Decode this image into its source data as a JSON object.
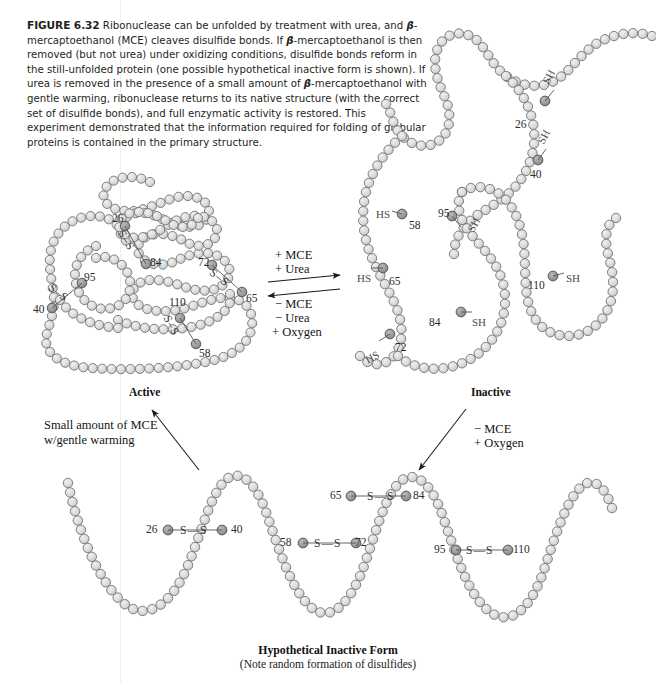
{
  "figure": {
    "number": "FIGURE 6.32",
    "caption_runs": [
      {
        "t": "FIGURE 6.32",
        "s": "fignum"
      },
      {
        "t": " Ribonuclease can be unfolded by treatment with urea, and ",
        "s": "plain"
      },
      {
        "t": "β",
        "s": "beta"
      },
      {
        "t": "-mercaptoethanol (MCE) cleaves disulfide bonds. If ",
        "s": "plain"
      },
      {
        "t": "β",
        "s": "beta"
      },
      {
        "t": "-mercaptoethanol is then removed (but not urea) under oxidizing conditions, disulfide bonds reform in the still-unfolded protein (one possible hypothetical inactive form is shown). If urea is removed in the presence of a small amount of ",
        "s": "plain"
      },
      {
        "t": "β",
        "s": "beta"
      },
      {
        "t": "-mercaptoethanol with gentle warming, ribonuclease returns to its native structure (with the correct set of disulfide bonds), and full enzymatic activity is restored. This experiment demonstrated that the information required for folding of globular proteins is contained in the primary structure.",
        "s": "plain"
      }
    ]
  },
  "colors": {
    "bead_fill": "#d9d9d9",
    "bead_stroke": "#6e6e6e",
    "cys_fill": "#9a9a9a",
    "cys_stroke": "#4a4a4a",
    "bond_line": "#555555",
    "text": "#1a1a1a"
  },
  "states": {
    "active_label": "Active",
    "inactive_label": "Inactive"
  },
  "center_arrows": {
    "forward_lines": [
      "+ MCE",
      "+ Urea"
    ],
    "reverse_lines": [
      "− MCE",
      "− Urea",
      "+ Oxygen"
    ]
  },
  "left_arrow": {
    "lines": [
      "Small amount of MCE",
      "w/gentle warming"
    ]
  },
  "right_arrow": {
    "lines": [
      "− MCE",
      "+ Oxygen"
    ]
  },
  "bottom": {
    "title": "Hypothetical Inactive Form",
    "subtitle": "(Note random formation of disulfides)"
  },
  "active_form": {
    "residue_labels": [
      "26",
      "84",
      "95",
      "40",
      "72",
      "65",
      "110",
      "58"
    ],
    "disulfide_pairs": [
      [
        "26",
        "84"
      ],
      [
        "95",
        "40"
      ],
      [
        "72",
        "65"
      ],
      [
        "110",
        "58"
      ]
    ],
    "bond_glyph": "S–S"
  },
  "inactive_form": {
    "residue_labels": [
      "26",
      "40",
      "58",
      "65",
      "72",
      "84",
      "95",
      "110"
    ],
    "thiol_glyph": "SH",
    "thiol_glyph_left": "HS",
    "free_thiols": [
      "26",
      "40",
      "58",
      "65",
      "72",
      "84",
      "95",
      "110"
    ]
  },
  "hypothetical_form": {
    "disulfide_pairs": [
      [
        "26",
        "40"
      ],
      [
        "58",
        "72"
      ],
      [
        "65",
        "84"
      ],
      [
        "95",
        "110"
      ]
    ],
    "bond_glyph": "S—S",
    "residue_labels": [
      "26",
      "40",
      "58",
      "65",
      "72",
      "84",
      "95",
      "110"
    ]
  }
}
